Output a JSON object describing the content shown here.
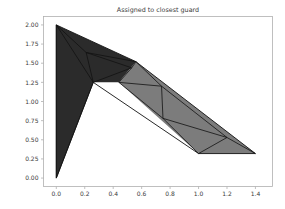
{
  "figure": {
    "title": "Assigned to closest guard",
    "background": "#ffffff",
    "axes_frame_color": "#b0b0b0",
    "tick_label_color": "#3a3a3a"
  },
  "chart_data": {
    "type": "polygon",
    "title": "Assigned to closest guard",
    "xlabel": "",
    "ylabel": "",
    "xlim": [
      -0.09,
      1.52
    ],
    "ylim": [
      -0.11,
      2.11
    ],
    "xticks": [
      0.0,
      0.2,
      0.4,
      0.6,
      0.8,
      1.0,
      1.2,
      1.4
    ],
    "xticklabels": [
      "0.0",
      "0.2",
      "0.4",
      "0.6",
      "0.8",
      "1.0",
      "1.2",
      "1.4"
    ],
    "yticks": [
      0.0,
      0.25,
      0.5,
      0.75,
      1.0,
      1.25,
      1.5,
      1.75,
      2.0
    ],
    "yticklabels": [
      "0.00",
      "0.25",
      "0.50",
      "0.75",
      "1.00",
      "1.25",
      "1.50",
      "1.75",
      "2.00"
    ],
    "grid": false,
    "legend": null,
    "colors": {
      "region_dark": "#2b2b2b",
      "region_light": "#7c7c7c",
      "edge": "#111111"
    },
    "boundary_polygon": [
      [
        0.0,
        2.0
      ],
      [
        0.56,
        1.52
      ],
      [
        1.4,
        0.32
      ],
      [
        1.0,
        0.32
      ],
      [
        0.26,
        1.25
      ],
      [
        0.0,
        0.0
      ]
    ],
    "regions": [
      {
        "name": "dark-region",
        "color": "#2b2b2b",
        "polygon": [
          [
            0.0,
            2.0
          ],
          [
            0.56,
            1.52
          ],
          [
            0.44,
            1.25
          ],
          [
            0.26,
            1.25
          ],
          [
            0.0,
            0.0
          ]
        ]
      },
      {
        "name": "light-region",
        "color": "#7c7c7c",
        "polygon": [
          [
            0.56,
            1.52
          ],
          [
            1.4,
            0.32
          ],
          [
            1.0,
            0.32
          ],
          [
            0.44,
            1.25
          ]
        ]
      }
    ],
    "triangulation_edges": [
      [
        [
          0.0,
          2.0
        ],
        [
          0.21,
          1.64
        ]
      ],
      [
        [
          0.21,
          1.64
        ],
        [
          0.26,
          1.25
        ]
      ],
      [
        [
          0.21,
          1.64
        ],
        [
          0.56,
          1.52
        ]
      ],
      [
        [
          0.21,
          1.64
        ],
        [
          0.53,
          1.44
        ]
      ],
      [
        [
          0.53,
          1.44
        ],
        [
          0.26,
          1.25
        ]
      ],
      [
        [
          0.53,
          1.44
        ],
        [
          0.44,
          1.25
        ]
      ],
      [
        [
          0.53,
          1.44
        ],
        [
          0.56,
          1.52
        ]
      ],
      [
        [
          0.0,
          2.0
        ],
        [
          0.26,
          1.25
        ]
      ],
      [
        [
          0.0,
          0.0
        ],
        [
          0.26,
          1.25
        ]
      ],
      [
        [
          0.0,
          2.0
        ],
        [
          0.0,
          0.0
        ]
      ],
      [
        [
          0.56,
          1.52
        ],
        [
          0.74,
          1.2
        ]
      ],
      [
        [
          0.74,
          1.2
        ],
        [
          0.44,
          1.25
        ]
      ],
      [
        [
          0.74,
          1.2
        ],
        [
          0.75,
          0.78
        ]
      ],
      [
        [
          0.75,
          0.78
        ],
        [
          0.44,
          1.25
        ]
      ],
      [
        [
          0.75,
          0.78
        ],
        [
          1.0,
          0.32
        ]
      ],
      [
        [
          0.74,
          1.2
        ],
        [
          1.2,
          0.53
        ]
      ],
      [
        [
          1.2,
          0.53
        ],
        [
          0.75,
          0.78
        ]
      ],
      [
        [
          1.2,
          0.53
        ],
        [
          1.0,
          0.32
        ]
      ],
      [
        [
          1.2,
          0.53
        ],
        [
          1.4,
          0.32
        ]
      ]
    ]
  }
}
